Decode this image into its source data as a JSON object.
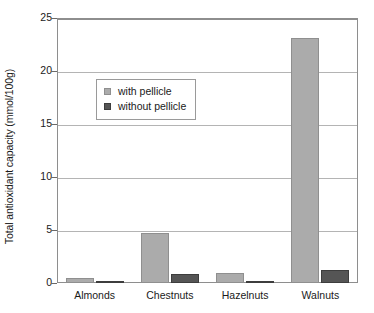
{
  "chart_data": {
    "type": "bar",
    "title": "",
    "xlabel": "",
    "ylabel": "Total antioxidant capacity (mmol/100g)",
    "categories": [
      "Almonds",
      "Chestnuts",
      "Hazelnuts",
      "Walnuts"
    ],
    "series": [
      {
        "name": "with pellicle",
        "color": "#ababab",
        "values": [
          0.45,
          4.75,
          0.9,
          23.1
        ]
      },
      {
        "name": "without pellicle",
        "color": "#555555",
        "values": [
          0.2,
          0.85,
          0.15,
          1.25
        ]
      }
    ],
    "ylim": [
      0,
      25
    ],
    "yticks": [
      0,
      5,
      10,
      15,
      20,
      25
    ],
    "ytick_labels": [
      "0",
      "5",
      "10",
      "15",
      "20",
      "25"
    ],
    "grid": true,
    "legend_position": "upper-left-inside"
  },
  "legend": {
    "items": [
      {
        "label": "with pellicle"
      },
      {
        "label": "without pellicle"
      }
    ]
  },
  "axis": {
    "y_title": "Total antioxidant capacity (mmol/100g)"
  }
}
